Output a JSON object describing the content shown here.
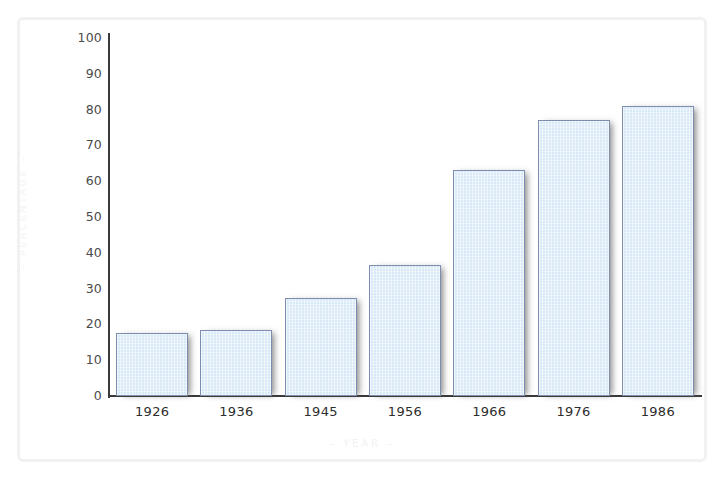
{
  "chart_data": {
    "type": "bar",
    "title": "",
    "xlabel": "– YEAR –",
    "ylabel": "– PERCENTAGE –",
    "categories": [
      "1926",
      "1936",
      "1945",
      "1956",
      "1966",
      "1976",
      "1986"
    ],
    "values": [
      17.5,
      18.5,
      27.5,
      36.5,
      63,
      77,
      81
    ],
    "ylim": [
      0,
      100
    ],
    "ytick_labels": [
      "100",
      "90",
      "80",
      "70",
      "60",
      "50",
      "40",
      "30",
      "20",
      "10",
      "0"
    ],
    "ytick_values": [
      100,
      90,
      80,
      70,
      60,
      50,
      40,
      30,
      20,
      10,
      0
    ],
    "grid": false,
    "legend": null,
    "bar_fill_color": "#d9e9f7",
    "bar_border_color": "#7d8dad",
    "axis_color": "#3a3a3a",
    "tick_label_color": "#4a4a4a",
    "axis_title_color": "#f2f2f2",
    "frame_color": "#f1f1f1",
    "background_color": "#ffffff"
  }
}
